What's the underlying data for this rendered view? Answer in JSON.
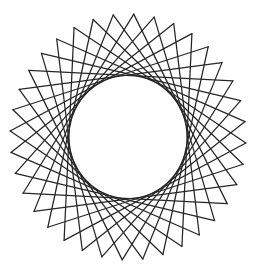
{
  "figure": {
    "type": "string-art star polygon",
    "background": "#ffffff",
    "line_color": "#262626",
    "outer_points": 36,
    "step": 12,
    "center": [
      128,
      137
    ],
    "radius_x": 118,
    "radius_y": 123,
    "rotation_deg": 2.8,
    "inner_envelope_radius": 60
  }
}
